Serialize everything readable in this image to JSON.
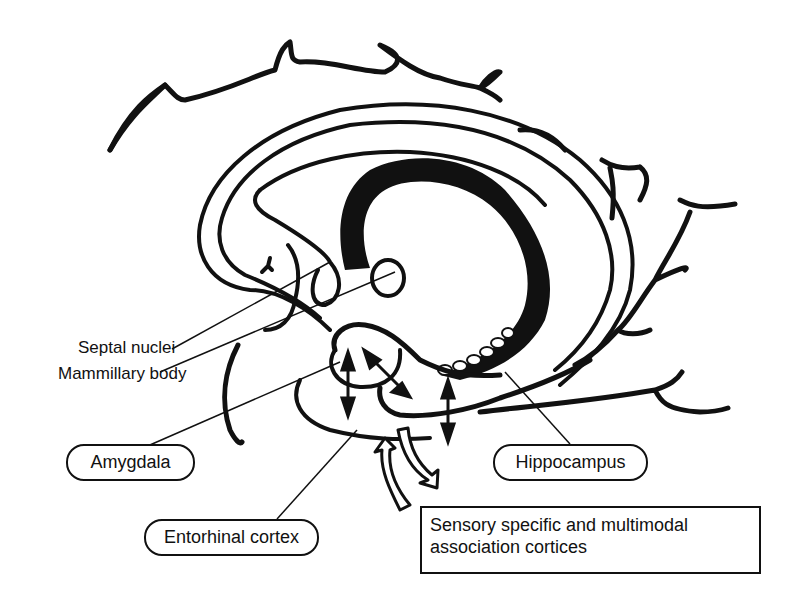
{
  "diagram": {
    "colors": {
      "ink": "#111111",
      "background": "#ffffff"
    },
    "labels": {
      "septal_nuclei": "Septal nuclei",
      "mammillary_body": "Mammillary body",
      "amygdala": "Amygdala",
      "hippocampus": "Hippocampus",
      "entorhinal_cortex": "Entorhinal cortex",
      "association_cortices": {
        "line1": "Sensory specific and multimodal",
        "line2": "association cortices"
      }
    },
    "structures": [
      "cortical-outline",
      "corpus-callosum",
      "fornix",
      "septal-nuclei",
      "mammillary-body",
      "amygdala",
      "hippocampus",
      "entorhinal-cortex",
      "bidirectional-arrows",
      "cortical-input-output-arrows"
    ]
  }
}
